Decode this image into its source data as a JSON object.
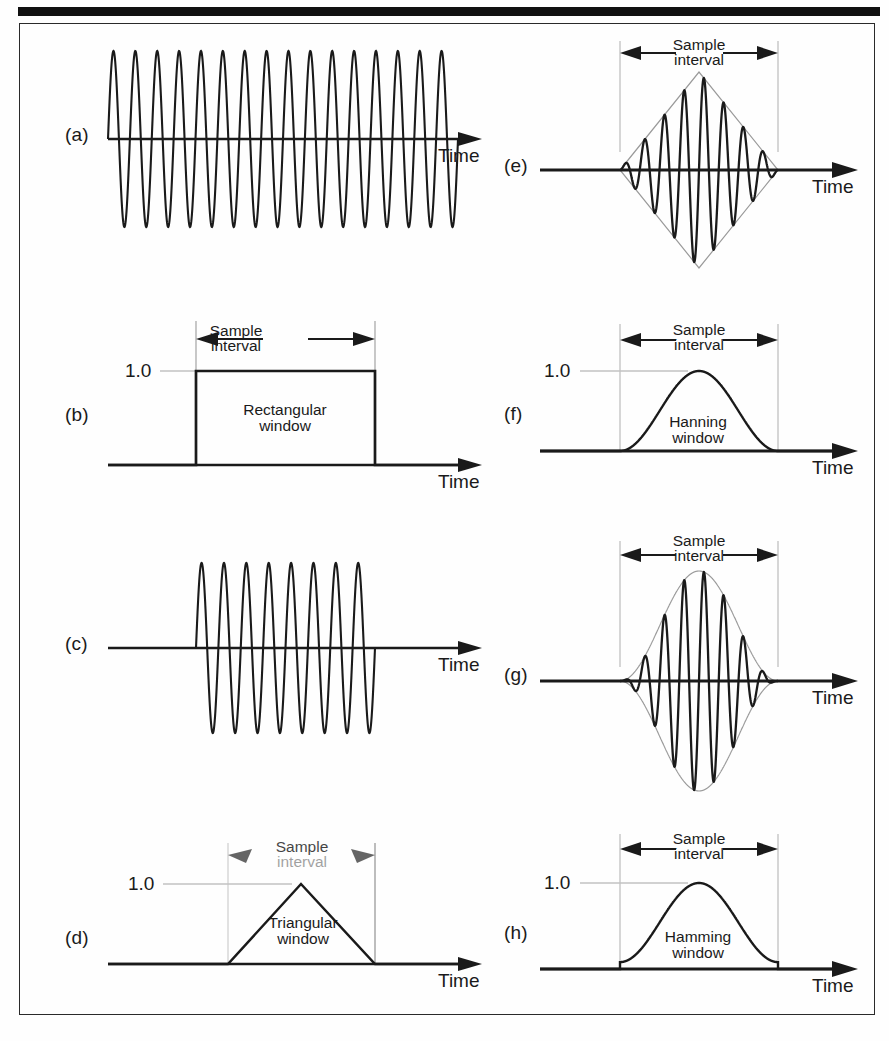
{
  "figure": {
    "background": "#fefefe",
    "ink": "#1a1a1a",
    "envelope_color": "#8a8a8a",
    "guide_color": "#b8b8b8",
    "top_rule_color": "#111111"
  },
  "labels": {
    "time_axis": "Time",
    "sample_interval_line1": "Sample",
    "sample_interval_line2": "interval",
    "amplitude_one": "1.0"
  },
  "panels": [
    {
      "id": "a",
      "label": "(a)",
      "kind": "continuous-sine",
      "window_name": null,
      "axis_label": "Time",
      "show_sample_interval": false,
      "show_amplitude_label": false,
      "cycles": 16,
      "description": "Continuous sine wave extending across the full record"
    },
    {
      "id": "b",
      "label": "(b)",
      "kind": "window",
      "window_name_line1": "Rectangular",
      "window_name_line2": "window",
      "axis_label": "Time",
      "show_sample_interval": true,
      "show_amplitude_label": true,
      "amplitude_peak": 1.0,
      "description": "Rectangular window: value 1.0 across the sample interval, 0 outside"
    },
    {
      "id": "c",
      "label": "(c)",
      "kind": "windowed-sine",
      "window_name": null,
      "axis_label": "Time",
      "show_sample_interval": false,
      "show_amplitude_label": false,
      "cycles": 8,
      "description": "Sine wave truncated by the rectangular window, abrupt ends"
    },
    {
      "id": "d",
      "label": "(d)",
      "kind": "window",
      "window_name_line1": "Triangular",
      "window_name_line2": "window",
      "axis_label": "Time",
      "show_sample_interval": true,
      "show_amplitude_label": true,
      "amplitude_peak": 1.0,
      "arrows_degraded": true,
      "description": "Triangular (Bartlett) window rising linearly to 1.0 at centre"
    },
    {
      "id": "e",
      "label": "(e)",
      "kind": "windowed-sine",
      "window_name": null,
      "axis_label": "Time",
      "show_sample_interval": true,
      "show_amplitude_label": false,
      "cycles": 8,
      "envelope": "triangular",
      "description": "Sine wave multiplied by the triangular window, diamond envelope"
    },
    {
      "id": "f",
      "label": "(f)",
      "kind": "window",
      "window_name_line1": "Hanning",
      "window_name_line2": "window",
      "axis_label": "Time",
      "show_sample_interval": true,
      "show_amplitude_label": true,
      "amplitude_peak": 1.0,
      "description": "Hanning (raised cosine) window, reaches zero at both edges"
    },
    {
      "id": "g",
      "label": "(g)",
      "kind": "windowed-sine",
      "window_name": null,
      "axis_label": "Time",
      "show_sample_interval": true,
      "show_amplitude_label": false,
      "cycles": 8,
      "envelope": "hanning",
      "description": "Sine wave multiplied by the Hanning window, smooth bell envelope"
    },
    {
      "id": "h",
      "label": "(h)",
      "kind": "window",
      "window_name_line1": "Hamming",
      "window_name_line2": "window",
      "axis_label": "Time",
      "show_sample_interval": true,
      "show_amplitude_label": true,
      "amplitude_peak": 1.0,
      "pedestal": true,
      "description": "Hamming window, raised cosine on a small non-zero pedestal"
    }
  ],
  "chart_data": {
    "type": "line",
    "title": "",
    "xlabel": "Time",
    "ylabel": "",
    "grid": false,
    "legend": "none",
    "panel_count": 8,
    "panels": [
      {
        "id": "a",
        "series": [
          {
            "name": "sine",
            "function": "sin",
            "cycles": 16,
            "amplitude": 1.0,
            "extent": "full-record"
          }
        ]
      },
      {
        "id": "b",
        "series": [
          {
            "name": "rectangular-window",
            "values_inside": 1.0,
            "values_outside": 0.0,
            "peak": 1.0
          }
        ]
      },
      {
        "id": "c",
        "series": [
          {
            "name": "rect-windowed-sine",
            "function": "sin",
            "cycles": 8,
            "amplitude": 1.0,
            "extent": "sample-interval"
          }
        ]
      },
      {
        "id": "d",
        "series": [
          {
            "name": "triangular-window",
            "function": "1-|2t-1|",
            "peak": 1.0,
            "edges": 0.0
          }
        ]
      },
      {
        "id": "e",
        "series": [
          {
            "name": "triangular-envelope",
            "function": "1-|2t-1|",
            "peak": 1.0
          },
          {
            "name": "triangle-windowed-sine",
            "function": "sin*triangle",
            "cycles": 8,
            "amplitude": 1.0
          }
        ]
      },
      {
        "id": "f",
        "series": [
          {
            "name": "hanning-window",
            "function": "0.5-0.5cos(2*pi*t)",
            "peak": 1.0,
            "edges": 0.0
          }
        ]
      },
      {
        "id": "g",
        "series": [
          {
            "name": "hanning-envelope",
            "function": "0.5-0.5cos(2*pi*t)",
            "peak": 1.0
          },
          {
            "name": "hanning-windowed-sine",
            "function": "sin*hanning",
            "cycles": 8,
            "amplitude": 1.0
          }
        ]
      },
      {
        "id": "h",
        "series": [
          {
            "name": "hamming-window",
            "function": "0.54-0.46cos(2*pi*t)",
            "peak": 1.0,
            "edges": 0.08
          }
        ]
      }
    ]
  }
}
